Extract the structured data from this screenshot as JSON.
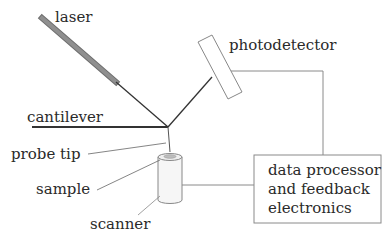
{
  "labels": {
    "laser": "laser",
    "photodetector": "photodetector",
    "cantilever": "cantilever",
    "probe_tip": "probe tip",
    "sample": "sample",
    "scanner": "scanner",
    "processor_line1": "data processor",
    "processor_line2": "and feedback",
    "processor_line3": "electronics"
  },
  "colors": {
    "laser_body": "#8c8c8c",
    "beam": "#333333",
    "cantilever": "#333333",
    "wire": "#8a8a8a",
    "text": "#2a2a2a"
  }
}
